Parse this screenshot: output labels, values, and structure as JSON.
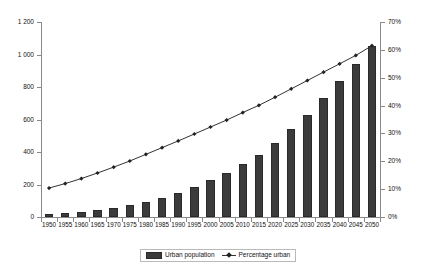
{
  "chart_data": {
    "type": "bar",
    "title": "",
    "xlabel": "",
    "ylabel": "",
    "y2label": "",
    "grid": false,
    "legend_position": "bottom",
    "categories": [
      "1950",
      "1955",
      "1960",
      "1965",
      "1970",
      "1975",
      "1980",
      "1985",
      "1990",
      "1995",
      "2000",
      "2005",
      "2010",
      "2015",
      "2020",
      "2025",
      "2030",
      "2035",
      "2040",
      "2045",
      "2050"
    ],
    "ylim": [
      0,
      1200
    ],
    "y2lim": [
      0,
      70
    ],
    "yticks": [
      "0",
      "200",
      "400",
      "600",
      "800",
      "1 000",
      "1 200"
    ],
    "ytick_values": [
      0,
      200,
      400,
      600,
      800,
      1000,
      1200
    ],
    "y2ticks": [
      "0%",
      "10%",
      "20%",
      "30%",
      "40%",
      "50%",
      "60%",
      "70%"
    ],
    "y2tick_values": [
      0,
      10,
      20,
      30,
      40,
      50,
      60,
      70
    ],
    "series": [
      {
        "name": "Urban population",
        "kind": "bar",
        "axis": "left",
        "color": "#3b3b3b",
        "values": [
          18,
          24,
          32,
          43,
          55,
          72,
          93,
          115,
          145,
          182,
          225,
          272,
          325,
          380,
          455,
          540,
          630,
          730,
          835,
          940,
          1050
        ]
      },
      {
        "name": "Percentage urban",
        "kind": "line",
        "axis": "right",
        "color": "#333333",
        "marker": "diamond",
        "values": [
          10.4,
          12.0,
          13.8,
          15.8,
          17.9,
          20.1,
          22.5,
          24.9,
          27.3,
          29.8,
          32.3,
          34.8,
          37.5,
          40.1,
          43.0,
          46.0,
          49.0,
          52.0,
          55.0,
          58.0,
          61.5
        ]
      }
    ]
  },
  "legend": {
    "items": [
      {
        "label": "Urban population",
        "marker": "bar-swatch"
      },
      {
        "label": "Percentage urban",
        "marker": "line-diamond"
      }
    ]
  }
}
